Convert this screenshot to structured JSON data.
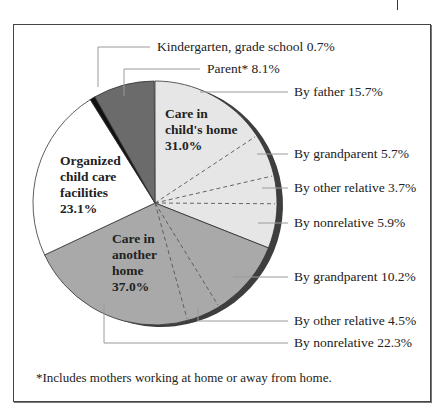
{
  "chart_data": {
    "type": "pie",
    "title": "",
    "start_angle_deg": 0,
    "direction": "clockwise",
    "slices": [
      {
        "label": "Care in child's home",
        "value": 31.0,
        "color": "#e6e6e6",
        "sub": [
          {
            "label": "By father",
            "value": 15.7
          },
          {
            "label": "By grandparent",
            "value": 5.7
          },
          {
            "label": "By other relative",
            "value": 3.7
          },
          {
            "label": "By nonrelative",
            "value": 5.9
          }
        ]
      },
      {
        "label": "Care in another home",
        "value": 37.0,
        "color": "#a9a9a9",
        "sub": [
          {
            "label": "By grandparent",
            "value": 10.2
          },
          {
            "label": "By other relative",
            "value": 4.5
          },
          {
            "label": "By nonrelative",
            "value": 22.3
          }
        ]
      },
      {
        "label": "Organized child care facilities",
        "value": 23.1,
        "color": "#ffffff"
      },
      {
        "label": "Kindergarten, grade school",
        "value": 0.7,
        "color": "#111111"
      },
      {
        "label": "Parent*",
        "value": 8.1,
        "color": "#6b6b6b"
      }
    ],
    "footnote": "*Includes mothers working at home or away from home."
  },
  "labels": {
    "kindergarten": "Kindergarten, grade school 0.7%",
    "parent": "Parent* 8.1%",
    "by_father": "By father 15.7%",
    "childs_grandparent": "By grandparent 5.7%",
    "childs_other_relative": "By other relative 3.7%",
    "childs_nonrelative": "By nonrelative 5.9%",
    "another_grandparent": "By grandparent 10.2%",
    "another_other_relative": "By other relative 4.5%",
    "another_nonrelative": "By nonrelative 22.3%",
    "childs_home": [
      "Care in",
      "child's home",
      "31.0%"
    ],
    "another_home": [
      "Care in",
      "another",
      "home",
      "37.0%"
    ],
    "organized": [
      "Organized",
      "child care",
      "facilities",
      "23.1%"
    ],
    "footnote": "*Includes mothers working at home or away from home."
  },
  "colors": {
    "rim": "#3e3e3e",
    "frame": "#444444",
    "leader": "#9a9a9a"
  }
}
